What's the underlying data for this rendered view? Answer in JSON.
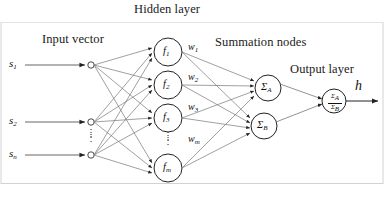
{
  "figure": {
    "type": "neural-network-diagram",
    "title_labels": {
      "hidden_layer": "Hidden layer",
      "input_vector": "Input vector",
      "summation_nodes": "Summation nodes",
      "output_layer": "Output layer"
    },
    "colors": {
      "stroke": "#555555",
      "node_stroke": "#222222",
      "text": "#111111",
      "background": "#ffffff",
      "border": "#c8c8c8"
    }
  },
  "input_layer": {
    "nodes": [
      {
        "label": "s",
        "sub": "1"
      },
      {
        "label": "s",
        "sub": "2"
      },
      {
        "label": "s",
        "sub": "n"
      }
    ],
    "vertical_ellipsis": "⋮"
  },
  "hidden_layer": {
    "nodes": [
      {
        "label": "f",
        "sub": "1"
      },
      {
        "label": "f",
        "sub": "2"
      },
      {
        "label": "f",
        "sub": "3"
      },
      {
        "label": "f",
        "sub": "m"
      }
    ],
    "vertical_ellipsis": "⋮"
  },
  "weights": {
    "labels": [
      {
        "label": "w",
        "sub": "1"
      },
      {
        "label": "w",
        "sub": "2"
      },
      {
        "label": "w",
        "sub": "3"
      },
      {
        "label": "w",
        "sub": "m"
      }
    ],
    "vertical_ellipsis": "⋮"
  },
  "summation_layer": {
    "nodes": [
      {
        "label": "Σ",
        "sub": "A"
      },
      {
        "label": "Σ",
        "sub": "B"
      }
    ]
  },
  "output_layer": {
    "node": {
      "numerator": "Σ",
      "numerator_sub": "A",
      "denominator": "Σ",
      "denominator_sub": "B"
    },
    "output_label": "h"
  }
}
